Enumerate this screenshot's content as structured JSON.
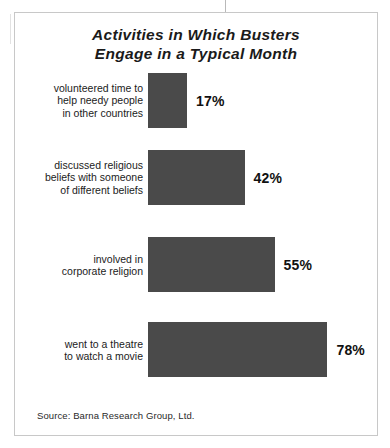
{
  "chart_data": {
    "type": "bar",
    "orientation": "horizontal",
    "title": "Activities in Which Busters Engage in a Typical Month",
    "title_lines": [
      "Activities in Which Busters",
      "Engage in a Typical Month"
    ],
    "xlabel": "",
    "ylabel": "",
    "xlim": [
      0,
      100
    ],
    "grid": false,
    "legend": false,
    "unit": "%",
    "bar_color": "#4a4a4a",
    "categories": [
      "volunteered time to help needy people in other countries",
      "discussed religious beliefs with someone of different beliefs",
      "involved in corporate religion",
      "went to a theatre to watch a movie"
    ],
    "values": [
      17,
      42,
      55,
      78
    ],
    "bars": [
      {
        "label_lines": [
          "volunteered time to",
          "help needy people",
          "in other countries"
        ],
        "value": 17,
        "value_label": "17%"
      },
      {
        "label_lines": [
          "discussed religious",
          "beliefs with someone",
          "of different beliefs"
        ],
        "value": 42,
        "value_label": "42%"
      },
      {
        "label_lines": [
          "involved in",
          "corporate religion"
        ],
        "value": 55,
        "value_label": "55%"
      },
      {
        "label_lines": [
          "went to a theatre",
          "to watch a movie"
        ],
        "value": 78,
        "value_label": "78%"
      }
    ],
    "source": "Source: Barna Research Group, Ltd."
  }
}
